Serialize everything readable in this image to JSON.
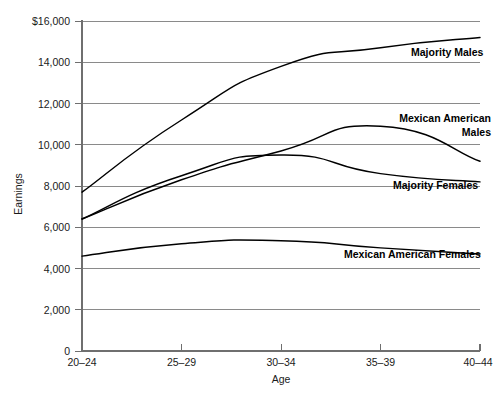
{
  "chart_data": {
    "type": "line",
    "title": "",
    "xlabel": "Age",
    "ylabel": "Earnings",
    "categories": [
      "20–24",
      "25–29",
      "30–34",
      "35–39",
      "40–44"
    ],
    "ylim": [
      0,
      16000
    ],
    "ytick_values": [
      0,
      2000,
      4000,
      6000,
      8000,
      10000,
      12000,
      14000,
      16000
    ],
    "ytick_labels": [
      "0",
      "2,000",
      "4,000",
      "6,000",
      "8,000",
      "10,000",
      "12,000",
      "14,000",
      "$16,000"
    ],
    "grid": true,
    "legend_position": "inline-right-of-lines",
    "series": [
      {
        "name": "Majority Males",
        "label": "Majority Males",
        "label_lines": [
          "Majority Males"
        ],
        "values": [
          7700,
          11200,
          13800,
          14700,
          15200
        ]
      },
      {
        "name": "Mexican American Males",
        "label": "Mexican American Males",
        "label_lines": [
          "Mexican American",
          "Males"
        ],
        "values": [
          6400,
          8300,
          9700,
          10900,
          9200
        ]
      },
      {
        "name": "Majority Females",
        "label": "Majority Females",
        "label_lines": [
          "Majority Females"
        ],
        "values": [
          6400,
          8500,
          9500,
          8600,
          8200
        ]
      },
      {
        "name": "Mexican American Females",
        "label": "Mexican American Females",
        "label_lines": [
          "Mexican American Females"
        ],
        "values": [
          4600,
          5200,
          5350,
          5000,
          4700
        ]
      }
    ]
  },
  "axis": {
    "y_title": "Earnings",
    "x_title": "Age",
    "ticks": {
      "y0": "0",
      "y2000": "2,000",
      "y4000": "4,000",
      "y6000": "6,000",
      "y8000": "8,000",
      "y10000": "10,000",
      "y12000": "12,000",
      "y14000": "14,000",
      "y16000": "$16,000"
    },
    "x_ticks": {
      "t0": "20–24",
      "t1": "25–29",
      "t2": "30–34",
      "t3": "35–39",
      "t4": "40–44"
    }
  },
  "labels": {
    "majority_males": "Majority Males",
    "mexican_american_males_line1": "Mexican American",
    "mexican_american_males_line2": "Males",
    "majority_females": "Majority Females",
    "mexican_american_females": "Mexican American Females"
  },
  "colors": {
    "line": "#000000",
    "grid": "#8a8a8a",
    "axis": "#6f6f6f",
    "text": "#1a1a1a",
    "background": "#ffffff"
  }
}
